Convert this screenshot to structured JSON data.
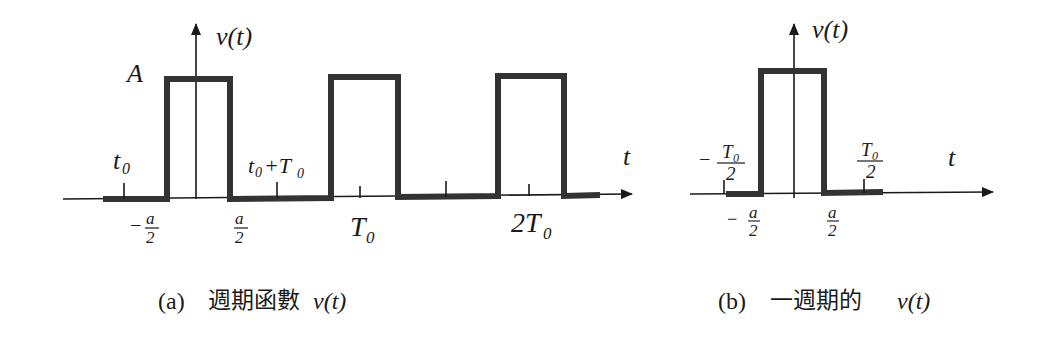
{
  "figure_a": {
    "caption_prefix": "(a)",
    "caption_cjk": "週期函數",
    "caption_func": "v(t)",
    "y_label": "v(t)",
    "x_label": "t",
    "amplitude_label": "A",
    "tick_labels": {
      "t0": "t",
      "t0_sub": "0",
      "t0_plus_T0": "t",
      "t0_plus_T0_sub": "0",
      "t0_plus_T0_rest": "+T",
      "t0_plus_T0_rest_sub": "0",
      "neg_a_half_sign": "−",
      "a_num": "a",
      "a_den": "2",
      "T0": "T",
      "T0_sub": "0",
      "two_T0": "2T",
      "two_T0_sub": "0"
    }
  },
  "figure_b": {
    "caption_prefix": "(b)",
    "caption_cjk": "一週期的",
    "caption_func": "v(t)",
    "y_label": "v(t)",
    "x_label": "t",
    "tick_labels": {
      "neg_sign": "−",
      "T0_num": "T",
      "T0_num_sub": "0",
      "T0_den": "2",
      "a_num": "a",
      "a_den": "2"
    }
  },
  "colors": {
    "signal": "#333333",
    "axis": "#1a1a1a",
    "background": "#ffffff"
  }
}
